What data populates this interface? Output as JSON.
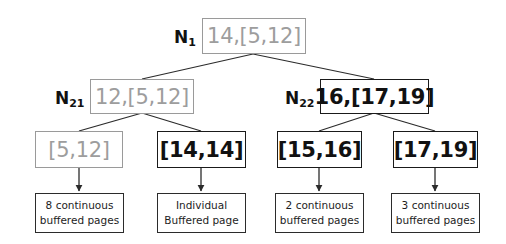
{
  "diagram": {
    "colors": {
      "gray_stroke": "#9a9a9a",
      "gray_text": "#9d9d9d",
      "black_stroke": "#1a1a1a",
      "black_text": "#111111",
      "background": "#ffffff"
    },
    "root": {
      "name_prefix": "N",
      "name_sub": "1",
      "value": "14,[5,12]",
      "style": "gray"
    },
    "level2": [
      {
        "name_prefix": "N",
        "name_sub": "21",
        "value": "12,[5,12]",
        "style": "gray"
      },
      {
        "name_prefix": "N",
        "name_sub": "22",
        "value": "16,[17,19]",
        "style": "black"
      }
    ],
    "leaves": [
      {
        "value": "[5,12]",
        "style": "gray"
      },
      {
        "value": "[14,14]",
        "style": "black"
      },
      {
        "value": "[15,16]",
        "style": "black"
      },
      {
        "value": "[17,19]",
        "style": "black"
      }
    ],
    "annotations": [
      {
        "line1": "8 continuous",
        "line2": "buffered pages"
      },
      {
        "line1": "Individual",
        "line2": "Buffered page"
      },
      {
        "line1": "2 continuous",
        "line2": "buffered pages"
      },
      {
        "line1": "3 continuous",
        "line2": "buffered pages"
      }
    ]
  }
}
